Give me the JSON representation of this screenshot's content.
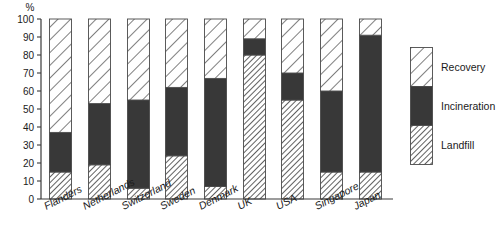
{
  "chart_data": {
    "type": "bar",
    "subtype": "stacked-bar",
    "title": "",
    "xlabel": "",
    "ylabel": "%",
    "ylim": [
      0,
      100
    ],
    "yticks": [
      0,
      10,
      20,
      30,
      40,
      50,
      60,
      70,
      80,
      90,
      100
    ],
    "ytick_labels": [
      "0",
      "10",
      "20",
      "30",
      "40",
      "50",
      "60",
      "70",
      "80",
      "90",
      "100"
    ],
    "grid": false,
    "legend_position": "right",
    "categories": [
      "Flanders",
      "Netherlands",
      "Switzerland",
      "Sweden",
      "Denmark",
      "UK",
      "USA",
      "Singapore",
      "Japan"
    ],
    "series": [
      {
        "name": "Landfill",
        "pattern": "fine-diagonal-hatch",
        "color": "#ffffff",
        "hatch_color": "#3a3a3a",
        "values": [
          15,
          19,
          6,
          24,
          7,
          80,
          55,
          15,
          15
        ]
      },
      {
        "name": "Incineration",
        "pattern": "solid",
        "color": "#383838",
        "hatch_color": "#383838",
        "values": [
          22,
          34,
          49,
          38,
          60,
          9,
          15,
          45,
          76
        ]
      },
      {
        "name": "Recovery",
        "pattern": "wide-diagonal-hatch",
        "color": "#ffffff",
        "hatch_color": "#3a3a3a",
        "values": [
          63,
          47,
          45,
          38,
          33,
          11,
          30,
          40,
          9
        ]
      }
    ],
    "cumulative_tops": {
      "landfill": [
        15,
        19,
        6,
        24,
        7,
        80,
        55,
        15,
        15
      ],
      "incineration": [
        37,
        53,
        55,
        62,
        67,
        89,
        70,
        60,
        91
      ],
      "recovery": [
        100,
        100,
        100,
        100,
        100,
        100,
        100,
        100,
        100
      ]
    }
  },
  "axis": {
    "unit": "%",
    "tick_labels": [
      "100",
      "90",
      "80",
      "70",
      "60",
      "50",
      "40",
      "30",
      "20",
      "10",
      "0"
    ]
  },
  "categories": [
    {
      "label": "Flanders"
    },
    {
      "label": "Netherlands"
    },
    {
      "label": "Switzerland"
    },
    {
      "label": "Sweden"
    },
    {
      "label": "Denmark"
    },
    {
      "label": "UK"
    },
    {
      "label": "USA"
    },
    {
      "label": "Singapore"
    },
    {
      "label": "Japan"
    }
  ],
  "legend": {
    "items": [
      {
        "label": "Recovery"
      },
      {
        "label": "Incineration"
      },
      {
        "label": "Landfill"
      }
    ]
  },
  "colors": {
    "incineration": "#383838",
    "hatch": "#3a3a3a",
    "axis": "#3a3a3a",
    "background": "#ffffff"
  }
}
